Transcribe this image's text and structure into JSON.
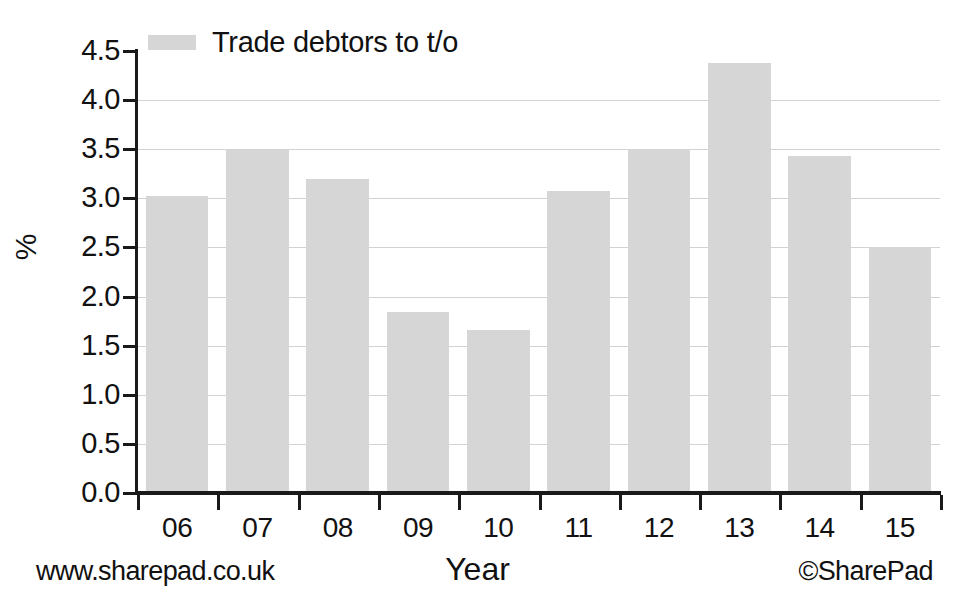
{
  "chart_data": {
    "type": "bar",
    "title": "",
    "subtitle": "",
    "categories": [
      "06",
      "07",
      "08",
      "09",
      "10",
      "11",
      "12",
      "13",
      "14",
      "15"
    ],
    "values": [
      3.02,
      3.49,
      3.2,
      1.84,
      1.66,
      3.07,
      3.5,
      4.38,
      3.43,
      2.5
    ],
    "series": [
      {
        "name": "Trade debtors to t/o",
        "values": [
          3.02,
          3.49,
          3.2,
          1.84,
          1.66,
          3.07,
          3.5,
          4.38,
          3.43,
          2.5
        ],
        "color": "#d6d6d6"
      }
    ],
    "xlabel": "Year",
    "ylabel": "%",
    "ylim": [
      0.0,
      4.5
    ],
    "yticks": [
      "0.0",
      "0.5",
      "1.0",
      "1.5",
      "2.0",
      "2.5",
      "3.0",
      "3.5",
      "4.0",
      "4.5"
    ],
    "ytick_values": [
      0.0,
      0.5,
      1.0,
      1.5,
      2.0,
      2.5,
      3.0,
      3.5,
      4.0,
      4.5
    ],
    "grid": true,
    "grid_color": "#d2d2d2",
    "legend": {
      "position": "top-left",
      "entries": [
        {
          "label": "Trade debtors to t/o",
          "color": "#d6d6d6"
        }
      ]
    },
    "bar_color": "#d6d6d6",
    "axis_color": "#1a1a1a",
    "background": "#ffffff"
  },
  "footer": {
    "left": "www.sharepad.co.uk",
    "right": "©SharePad"
  }
}
